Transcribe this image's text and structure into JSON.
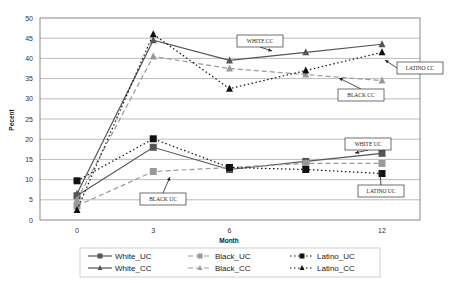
{
  "chart_data": {
    "type": "line",
    "title": "",
    "xlabel": "Month",
    "ylabel": "Pecent",
    "x": [
      0,
      3,
      6,
      9,
      12
    ],
    "xticks": [
      "0",
      "3",
      "6",
      "12"
    ],
    "xtick_values": [
      0,
      3,
      6,
      12
    ],
    "yticks": [
      0,
      5,
      10,
      15,
      20,
      25,
      30,
      35,
      40,
      45,
      50
    ],
    "ylim": [
      0,
      50
    ],
    "grid": true,
    "legend_position": "bottom",
    "series": [
      {
        "name": "White_UC",
        "values": [
          6,
          18,
          12.5,
          14.5,
          16.5
        ],
        "color": "#555555",
        "dash": "solid",
        "marker": "square"
      },
      {
        "name": "Black_UC",
        "values": [
          3.5,
          12,
          13,
          14,
          14
        ],
        "color": "#999999",
        "dash": "dashed",
        "marker": "square"
      },
      {
        "name": "Latino_UC",
        "values": [
          9.7,
          20.1,
          13,
          12.5,
          11.5
        ],
        "color": "#111111",
        "dash": "dotted",
        "marker": "square"
      },
      {
        "name": "White_CC",
        "values": [
          6.5,
          44.5,
          39.5,
          41.5,
          43.5
        ],
        "color": "#555555",
        "dash": "solid",
        "marker": "triangle"
      },
      {
        "name": "Black_CC",
        "values": [
          5,
          40.5,
          37.5,
          36,
          34.5
        ],
        "color": "#999999",
        "dash": "dashed",
        "marker": "triangle"
      },
      {
        "name": "Latino_CC",
        "values": [
          2.5,
          46,
          32.5,
          37,
          41.5
        ],
        "color": "#111111",
        "dash": "dotted",
        "marker": "triangle"
      }
    ],
    "annotations": [
      {
        "text": "WHITE CC",
        "box": [
          237,
          35,
          46,
          12
        ],
        "arrow_to": [
          272,
          51
        ]
      },
      {
        "text": "LATINO CC",
        "box": [
          397,
          62,
          46,
          12
        ],
        "arrow_to": [
          385,
          60
        ]
      },
      {
        "text": "BLACK CC",
        "box": [
          338,
          89,
          46,
          12
        ],
        "arrow_to": [
          339,
          78
        ]
      },
      {
        "text": "WHITE UC",
        "box": [
          345,
          138,
          46,
          12
        ],
        "arrow_to": [
          355,
          153
        ]
      },
      {
        "text": "LATINO UC",
        "box": [
          358,
          185,
          46,
          12
        ],
        "arrow_to": [
          380,
          171
        ]
      },
      {
        "text": "BLACK UC",
        "box": [
          140,
          193,
          46,
          12
        ],
        "arrow_to": [
          170,
          177
        ]
      }
    ]
  }
}
